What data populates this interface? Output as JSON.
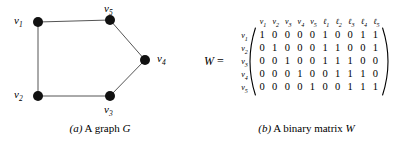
{
  "figure_a": {
    "name": "graph-figure",
    "caption_mark": "(a)",
    "caption_text": "A graph",
    "caption_symbol": "G",
    "vertices": [
      {
        "id": "v1",
        "label": "v",
        "sub": "1",
        "cx": 38,
        "cy": 22,
        "label_x": 14,
        "label_y": 15
      },
      {
        "id": "v2",
        "label": "v",
        "sub": "2",
        "cx": 38,
        "cy": 96,
        "label_x": 14,
        "label_y": 89
      },
      {
        "id": "v3",
        "label": "v",
        "sub": "3",
        "cx": 110,
        "cy": 96,
        "label_x": 104,
        "label_y": 104
      },
      {
        "id": "v4",
        "label": "v",
        "sub": "4",
        "cx": 145,
        "cy": 60,
        "label_x": 157,
        "label_y": 53
      },
      {
        "id": "v5",
        "label": "v",
        "sub": "5",
        "cx": 110,
        "cy": 20,
        "label_x": 104,
        "label_y": 3
      }
    ],
    "edges": [
      {
        "from": "v1",
        "to": "v5"
      },
      {
        "from": "v5",
        "to": "v4"
      },
      {
        "from": "v4",
        "to": "v3"
      },
      {
        "from": "v3",
        "to": "v2"
      },
      {
        "from": "v2",
        "to": "v1"
      }
    ],
    "vertex_radius": 5,
    "vertex_color": "#111111",
    "edge_color": "#555555"
  },
  "figure_b": {
    "name": "matrix-figure",
    "matrix_name": "W",
    "equals": "=",
    "caption_mark": "(b)",
    "caption_text": "A binary matrix",
    "caption_symbol": "W",
    "column_headers": [
      {
        "label": "v",
        "sub": "1"
      },
      {
        "label": "v",
        "sub": "2"
      },
      {
        "label": "v",
        "sub": "3"
      },
      {
        "label": "v",
        "sub": "4"
      },
      {
        "label": "v",
        "sub": "5"
      },
      {
        "label": "ℓ",
        "sub": "1"
      },
      {
        "label": "ℓ",
        "sub": "2"
      },
      {
        "label": "ℓ",
        "sub": "3"
      },
      {
        "label": "ℓ",
        "sub": "4"
      },
      {
        "label": "ℓ",
        "sub": "5"
      }
    ],
    "row_headers": [
      {
        "label": "v",
        "sub": "1"
      },
      {
        "label": "v",
        "sub": "2"
      },
      {
        "label": "v",
        "sub": "3"
      },
      {
        "label": "v",
        "sub": "4"
      },
      {
        "label": "v",
        "sub": "5"
      }
    ],
    "rows": [
      [
        1,
        0,
        0,
        0,
        0,
        1,
        0,
        0,
        1,
        1
      ],
      [
        0,
        1,
        0,
        0,
        0,
        1,
        1,
        0,
        0,
        1
      ],
      [
        0,
        0,
        1,
        0,
        0,
        1,
        1,
        1,
        0,
        0
      ],
      [
        0,
        0,
        0,
        1,
        0,
        0,
        1,
        1,
        1,
        0
      ],
      [
        0,
        0,
        0,
        0,
        1,
        0,
        0,
        1,
        1,
        1
      ]
    ]
  }
}
